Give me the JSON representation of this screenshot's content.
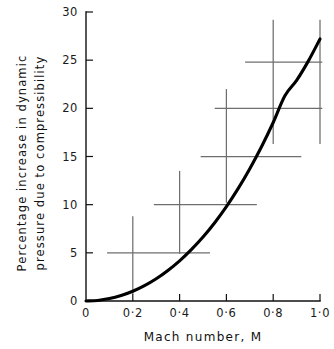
{
  "chart_data": {
    "type": "line",
    "title": "",
    "subtitle": "",
    "xlabel": "Mach number, M",
    "ylabel_line1": "Percentage increase in dynamic",
    "ylabel_line2": "pressure due to compressibility",
    "xlim": [
      0,
      1.0
    ],
    "ylim": [
      0,
      30
    ],
    "grid": false,
    "legend": "none",
    "xticks": [
      0,
      0.2,
      0.4,
      0.6,
      0.8,
      1.0
    ],
    "xtick_labels": [
      "0",
      "0·2",
      "0·4",
      "0·6",
      "0·8",
      "1·0"
    ],
    "yticks": [
      0,
      5,
      10,
      15,
      20,
      25,
      30
    ],
    "ytick_labels": [
      "0",
      "5",
      "10",
      "15",
      "20",
      "25",
      "30"
    ],
    "series": [
      {
        "name": "Compressibility correction curve",
        "style": "solid-thick-black",
        "x": [
          0.0,
          0.05,
          0.1,
          0.15,
          0.2,
          0.25,
          0.3,
          0.35,
          0.4,
          0.45,
          0.5,
          0.55,
          0.6,
          0.65,
          0.7,
          0.75,
          0.8,
          0.85,
          0.9,
          0.95,
          1.0
        ],
        "y": [
          0.0,
          0.06,
          0.25,
          0.57,
          1.01,
          1.59,
          2.31,
          3.17,
          4.17,
          5.33,
          6.64,
          8.13,
          9.8,
          11.66,
          13.73,
          16.01,
          18.53,
          21.31,
          22.9,
          24.9,
          27.2
        ]
      }
    ],
    "error_crosses": [
      {
        "label": "cross-1",
        "x_center": 0.2,
        "y_center": 5.0,
        "x_low": 0.09,
        "x_high": 0.53,
        "y_low": 0.7,
        "y_high": 8.8
      },
      {
        "label": "cross-2",
        "x_center": 0.4,
        "y_center": 10.0,
        "x_low": 0.29,
        "x_high": 0.73,
        "y_low": 4.9,
        "y_high": 13.5
      },
      {
        "label": "cross-3",
        "x_center": 0.6,
        "y_center": 15.0,
        "x_low": 0.49,
        "x_high": 0.92,
        "y_low": 10.2,
        "y_high": 22.0
      },
      {
        "label": "cross-4",
        "x_center": 0.8,
        "y_center": 20.0,
        "x_low": 0.55,
        "x_high": 1.01,
        "y_low": 16.3,
        "y_high": 29.2
      },
      {
        "label": "cross-5",
        "x_center": 1.0,
        "y_center": 24.8,
        "x_low": 0.68,
        "x_high": 1.01,
        "y_low": 16.3,
        "y_high": 29.2
      }
    ],
    "colors": {
      "curve": "#000000",
      "error_bars": "#6e6e6e",
      "axes": "#111111",
      "text": "#111111",
      "background": "#ffffff"
    }
  }
}
